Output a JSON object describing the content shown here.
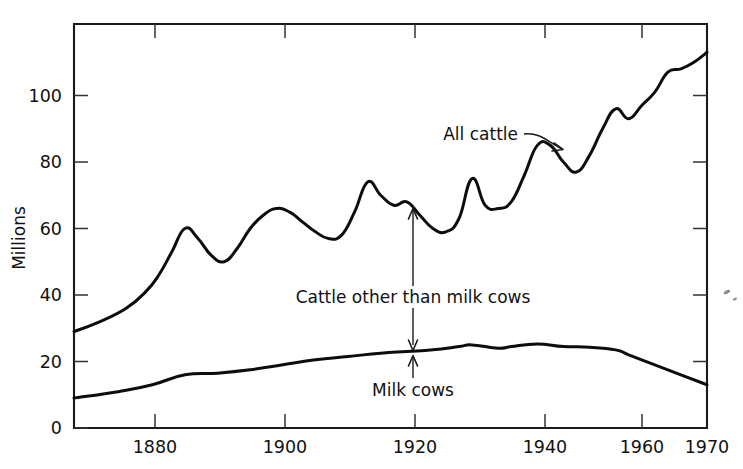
{
  "chart_data": {
    "type": "line",
    "title": "",
    "subtitle": "",
    "xlabel": "",
    "ylabel": "Millions",
    "xlim": [
      1873,
      1970
    ],
    "ylim": [
      0,
      118
    ],
    "grid": false,
    "legend_position": "inline-annotations",
    "xticks": [
      1880,
      1900,
      1920,
      1940,
      1960,
      1970
    ],
    "xticklabels": [
      "1880",
      "1900",
      "1920",
      "1940",
      "1960",
      "1970"
    ],
    "yticks": [
      0,
      20,
      40,
      60,
      80,
      100
    ],
    "yticklabels": [
      "0",
      "20",
      "40",
      "60",
      "80",
      "100"
    ],
    "series": [
      {
        "name": "All cattle",
        "x": [
          1873,
          1877,
          1881,
          1884,
          1886,
          1888,
          1890,
          1892,
          1894,
          1896,
          1898,
          1900,
          1902,
          1904,
          1906,
          1908,
          1910,
          1912,
          1914,
          1916,
          1918,
          1920,
          1922,
          1924,
          1926,
          1928,
          1930,
          1932,
          1934,
          1936,
          1938,
          1940,
          1942,
          1944,
          1946,
          1948,
          1950,
          1952,
          1954,
          1956,
          1958,
          1960,
          1962,
          1964,
          1966,
          1968,
          1970
        ],
        "values": [
          29,
          32,
          36,
          41,
          46,
          53,
          60,
          57,
          52,
          50,
          54,
          60,
          64,
          66,
          65,
          62,
          59,
          57,
          58,
          65,
          74,
          70,
          67,
          68,
          64,
          60,
          59,
          63,
          75,
          67,
          66,
          68,
          76,
          85,
          85,
          80,
          77,
          82,
          90,
          96,
          93,
          97,
          101,
          107,
          108,
          110,
          113
        ]
      },
      {
        "name": "Milk cows",
        "x": [
          1873,
          1880,
          1885,
          1890,
          1895,
          1900,
          1905,
          1910,
          1915,
          1920,
          1924,
          1928,
          1932,
          1934,
          1938,
          1940,
          1944,
          1948,
          1952,
          1956,
          1958,
          1962,
          1966,
          1970
        ],
        "values": [
          9,
          11,
          13,
          16,
          16.5,
          17.5,
          19,
          20.5,
          21.5,
          22.5,
          23,
          23.5,
          24.5,
          25,
          24,
          24.5,
          25.3,
          24.5,
          24.3,
          23.5,
          22,
          19,
          16,
          13
        ]
      }
    ],
    "annotations": [
      {
        "name": "all-cattle-label",
        "text": "All cattle",
        "x": 1931,
        "y": 86
      },
      {
        "name": "cattle-other-label",
        "text": "Cattle other than milk cows",
        "x": 1922,
        "y": 39
      },
      {
        "name": "milk-cows-label",
        "text": "Milk cows",
        "x": 1922,
        "y": 11
      },
      {
        "name": "span-arrow",
        "text": "",
        "x": 1922,
        "y_top": 67,
        "y_bottom": 23
      }
    ]
  },
  "labels": {
    "ylabel": "Millions",
    "all_cattle": "All cattle",
    "cattle_other": "Cattle other than milk cows",
    "milk_cows": "Milk cows",
    "x_1880": "1880",
    "x_1900": "1900",
    "x_1920": "1920",
    "x_1940": "1940",
    "x_1960": "1960",
    "x_1970": "1970",
    "y_0": "0",
    "y_20": "20",
    "y_40": "40",
    "y_60": "60",
    "y_80": "80",
    "y_100": "100"
  },
  "colors": {
    "line": "#0d0d0d",
    "axis": "#1a1a1a",
    "background": "#ffffff",
    "text": "#111111"
  }
}
